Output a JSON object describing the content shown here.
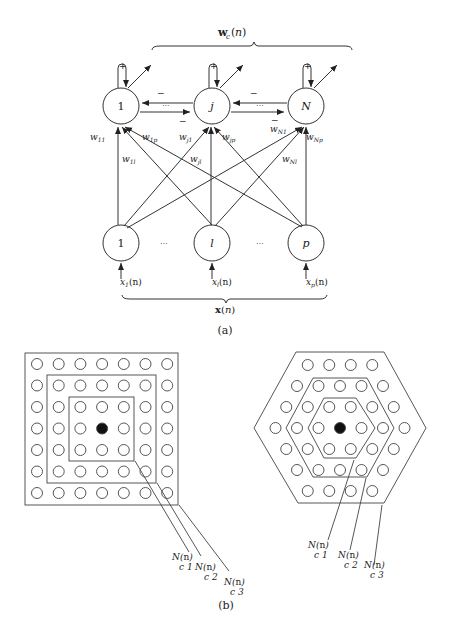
{
  "figure_a": {
    "caption": "(a)",
    "top_brace_label": "w_c(n)",
    "bottom_brace_label": "x(n)",
    "output_nodes": [
      {
        "label": "1",
        "x": 121,
        "y": 106
      },
      {
        "label": "j",
        "x": 212,
        "y": 106
      },
      {
        "label": "N",
        "x": 306,
        "y": 106
      }
    ],
    "input_nodes": [
      {
        "label": "1",
        "x": 121,
        "y": 243
      },
      {
        "label": "l",
        "x": 212,
        "y": 243
      },
      {
        "label": "p",
        "x": 306,
        "y": 243
      }
    ],
    "self_feedback_sign": "+",
    "lateral_sign": "−",
    "ellipsis": "···",
    "inputs": [
      "x1(n)",
      "xl(n)",
      "xp(n)"
    ],
    "weights": [
      "w11",
      "w1p",
      "wj1",
      "wjp",
      "wN1",
      "wNp",
      "w1l",
      "wjl",
      "wNl"
    ]
  },
  "figure_b": {
    "caption": "(b)",
    "square_grid": {
      "rows": 7,
      "cols": 7,
      "center": "filled"
    },
    "hex_grid": {
      "rings": 3,
      "center": "filled"
    },
    "neighborhood_labels": [
      {
        "name": "N(n)",
        "sub": "c 1"
      },
      {
        "name": "N(n)",
        "sub": "c 2"
      },
      {
        "name": "N(n)",
        "sub": "c 3"
      }
    ]
  }
}
